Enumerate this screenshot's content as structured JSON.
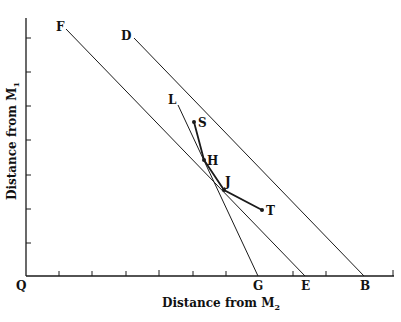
{
  "diagram": {
    "x_axis": {
      "title": "Distance from M",
      "subscript": "2"
    },
    "y_axis": {
      "title": "Distance from M",
      "subscript": "1"
    },
    "origin_label": "Q",
    "point_labels": {
      "F": "F",
      "D": "D",
      "L": "L",
      "S": "S",
      "H": "H",
      "J": "J",
      "T": "T",
      "G": "G",
      "E": "E",
      "B": "B"
    },
    "colors": {
      "line": "#1a1a1a",
      "axis": "#1a1a1a",
      "background": "#ffffff"
    },
    "lines": [
      {
        "name": "FE",
        "from": [
          66,
          28
        ],
        "to": [
          305,
          276
        ]
      },
      {
        "name": "DB",
        "from": [
          133,
          37
        ],
        "to": [
          364,
          276
        ]
      },
      {
        "name": "LG",
        "from": [
          178,
          104
        ],
        "to": [
          258,
          276
        ]
      },
      {
        "name": "S-H-J-T",
        "points": [
          [
            194,
            122
          ],
          [
            204,
            160
          ],
          [
            224,
            190
          ],
          [
            262,
            210
          ]
        ]
      }
    ],
    "x_ticks": [
      59,
      92,
      126,
      159,
      193,
      226,
      293,
      326,
      393
    ],
    "y_ticks": [
      38,
      72,
      106,
      140,
      175,
      209,
      243
    ]
  }
}
